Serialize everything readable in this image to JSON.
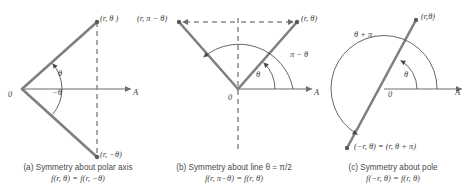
{
  "figure": {
    "stroke_color": "#808080",
    "axis_color": "#6e6e6e",
    "text_color": "#3b3b3b"
  },
  "panels": [
    {
      "id": "a",
      "caption_line1": "(a) Symmetry about polar axis",
      "caption_line2": "f(r, θ) = f(r, −θ)",
      "origin_label": "0",
      "axis_label": "A",
      "point_upper": "(r, θ )",
      "point_lower": "(r, −θ)",
      "angle_upper": "θ",
      "angle_lower": "−θ"
    },
    {
      "id": "b",
      "caption_line1": "(b) Symmetry about line θ = π/2",
      "caption_line2": "f(r, π−θ) = f(r, θ)",
      "origin_label": "0",
      "axis_label": "A",
      "point_left": "(r, π − θ)",
      "point_right": "(r, θ)",
      "angle_inner": "θ",
      "angle_outer": "π − θ"
    },
    {
      "id": "c",
      "caption_line1": "(c) Symmetry about pole",
      "caption_line2": "f(−r, θ) = f(r, θ)",
      "origin_label": "0",
      "axis_label": "A",
      "point_upper": "(r,θ)",
      "point_lower": "(−r, θ) = (r, θ + π)",
      "angle_inner": "θ",
      "angle_outer": "θ + π"
    }
  ]
}
